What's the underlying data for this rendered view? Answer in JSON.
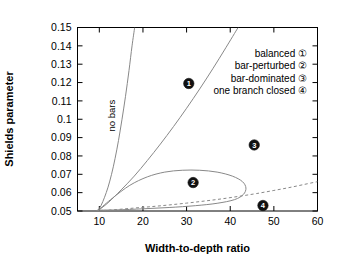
{
  "chart_data": {
    "type": "line",
    "title": "",
    "xlabel": "Width-to-depth ratio",
    "ylabel": "Shields parameter",
    "xlim": [
      5,
      60
    ],
    "ylim": [
      0.05,
      0.15
    ],
    "xticks": [
      "10",
      "20",
      "30",
      "40",
      "50",
      "60"
    ],
    "xtick_values": [
      10,
      20,
      30,
      40,
      50,
      60
    ],
    "yticks": [
      "0.05",
      "0.06",
      "0.07",
      "0.08",
      "0.09",
      "0.1",
      "0.11",
      "0.12",
      "0.13",
      "0.14",
      "0.15"
    ],
    "ytick_values": [
      0.05,
      0.06,
      0.07,
      0.08,
      0.09,
      0.1,
      0.11,
      0.12,
      0.13,
      0.14,
      0.15
    ],
    "grid": false,
    "legend_position": "upper-right",
    "annotations": [
      {
        "text": "no bars",
        "x": 13.5,
        "y": 0.102,
        "rotation": -90
      }
    ],
    "series": [
      {
        "name": "first-mode-threshold",
        "style": "solid",
        "points": [
          [
            9.6,
            0.05
          ],
          [
            10.4,
            0.053
          ],
          [
            11.2,
            0.0575
          ],
          [
            12.0,
            0.063
          ],
          [
            12.8,
            0.07
          ],
          [
            13.6,
            0.0785
          ],
          [
            14.4,
            0.0885
          ],
          [
            15.2,
            0.1
          ],
          [
            16.0,
            0.1125
          ],
          [
            16.8,
            0.1265
          ],
          [
            17.5,
            0.14
          ],
          [
            18.1,
            0.15
          ]
        ]
      },
      {
        "name": "second-mode-threshold",
        "style": "solid",
        "points": [
          [
            9.6,
            0.05
          ],
          [
            12.0,
            0.0545
          ],
          [
            15.0,
            0.0615
          ],
          [
            18.0,
            0.069
          ],
          [
            21.0,
            0.0775
          ],
          [
            24.0,
            0.0865
          ],
          [
            27.0,
            0.096
          ],
          [
            30.0,
            0.106
          ],
          [
            33.0,
            0.1165
          ],
          [
            36.0,
            0.1275
          ],
          [
            39.0,
            0.139
          ],
          [
            41.8,
            0.15
          ]
        ]
      },
      {
        "name": "closed-loop-region",
        "style": "solid",
        "points": [
          [
            9.8,
            0.0505
          ],
          [
            13.0,
            0.057
          ],
          [
            17.0,
            0.064
          ],
          [
            21.0,
            0.0686
          ],
          [
            25.0,
            0.0712
          ],
          [
            29.0,
            0.0722
          ],
          [
            33.0,
            0.0722
          ],
          [
            37.0,
            0.0712
          ],
          [
            40.5,
            0.069
          ],
          [
            42.8,
            0.066
          ],
          [
            43.6,
            0.0625
          ],
          [
            43.0,
            0.059
          ],
          [
            41.0,
            0.0562
          ],
          [
            37.0,
            0.0542
          ],
          [
            32.0,
            0.0529
          ],
          [
            26.0,
            0.0519
          ],
          [
            20.0,
            0.0512
          ],
          [
            14.0,
            0.0506
          ],
          [
            9.8,
            0.0505
          ]
        ]
      },
      {
        "name": "lower-branch-dashed",
        "style": "dashed",
        "points": [
          [
            9.6,
            0.05
          ],
          [
            14.0,
            0.0508
          ],
          [
            18.0,
            0.0516
          ],
          [
            22.0,
            0.0524
          ],
          [
            26.0,
            0.0533
          ],
          [
            30.0,
            0.0543
          ],
          [
            34.0,
            0.0554
          ],
          [
            38.0,
            0.0566
          ],
          [
            42.0,
            0.058
          ],
          [
            46.0,
            0.0595
          ],
          [
            50.0,
            0.0612
          ],
          [
            54.0,
            0.063
          ],
          [
            58.0,
            0.065
          ],
          [
            60.0,
            0.066
          ]
        ]
      }
    ],
    "markers": [
      {
        "id": "1",
        "label": "balanced",
        "x": 30.5,
        "y": 0.1195
      },
      {
        "id": "2",
        "label": "bar-perturbed",
        "x": 31.5,
        "y": 0.0655
      },
      {
        "id": "3",
        "label": "bar-dominated",
        "x": 45.5,
        "y": 0.086
      },
      {
        "id": "4",
        "label": "one branch closed",
        "x": 47.5,
        "y": 0.053
      }
    ],
    "legend": [
      {
        "label": "balanced",
        "symbol": "①"
      },
      {
        "label": "bar-perturbed",
        "symbol": "②"
      },
      {
        "label": "bar-dominated",
        "symbol": "③"
      },
      {
        "label": "one branch closed",
        "symbol": "④"
      }
    ]
  }
}
